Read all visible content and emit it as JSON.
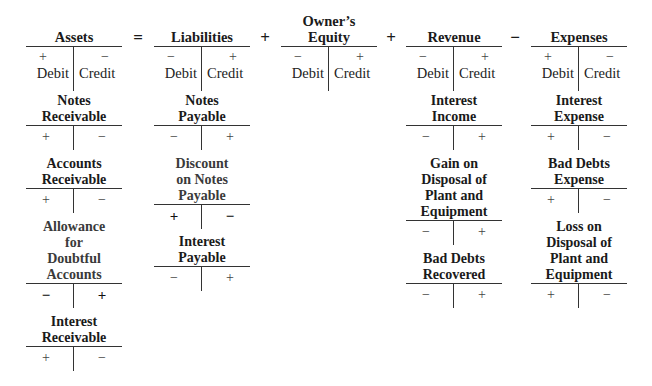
{
  "equation": {
    "operators": [
      "=",
      "+",
      "+",
      "−"
    ],
    "columns": [
      {
        "title": "Assets",
        "debit_sign": "+",
        "credit_sign": "−",
        "debit_label": "Debit",
        "credit_label": "Credit"
      },
      {
        "title": "Liabilities",
        "debit_sign": "−",
        "credit_sign": "+",
        "debit_label": "Debit",
        "credit_label": "Credit"
      },
      {
        "title_line1": "Owner’s",
        "title_line2": "Equity",
        "debit_sign": "−",
        "credit_sign": "+",
        "debit_label": "Debit",
        "credit_label": "Credit"
      },
      {
        "title": "Revenue",
        "debit_sign": "−",
        "credit_sign": "+",
        "debit_label": "Debit",
        "credit_label": "Credit"
      },
      {
        "title": "Expenses",
        "debit_sign": "+",
        "credit_sign": "−",
        "debit_label": "Debit",
        "credit_label": "Credit"
      }
    ]
  },
  "accounts": {
    "assets": [
      {
        "lines": [
          "Notes",
          "Receivable"
        ],
        "left": "+",
        "right": "−"
      },
      {
        "lines": [
          "Accounts",
          "Receivable"
        ],
        "left": "+",
        "right": "−"
      },
      {
        "lines": [
          "Allowance",
          "for",
          "Doubtful",
          "Accounts"
        ],
        "left": "−",
        "right": "+"
      },
      {
        "lines": [
          "Interest",
          "Receivable"
        ],
        "left": "+",
        "right": "−"
      }
    ],
    "liabilities": [
      {
        "lines": [
          "Notes",
          "Payable"
        ],
        "left": "−",
        "right": "+"
      },
      {
        "lines": [
          "Discount",
          "on Notes",
          "Payable"
        ],
        "left": "+",
        "right": "−"
      },
      {
        "lines": [
          "Interest",
          "Payable"
        ],
        "left": "−",
        "right": "+"
      }
    ],
    "revenue": [
      {
        "lines": [
          "Interest",
          "Income"
        ],
        "left": "−",
        "right": "+"
      },
      {
        "lines": [
          "Gain on",
          "Disposal of",
          "Plant and",
          "Equipment"
        ],
        "left": "−",
        "right": "+"
      },
      {
        "lines": [
          "Bad Debts",
          "Recovered"
        ],
        "left": "−",
        "right": "+"
      }
    ],
    "expenses": [
      {
        "lines": [
          "Interest",
          "Expense"
        ],
        "left": "+",
        "right": "−"
      },
      {
        "lines": [
          "Bad Debts",
          "Expense"
        ],
        "left": "+",
        "right": "−"
      },
      {
        "lines": [
          "Loss on",
          "Disposal of",
          "Plant and",
          "Equipment"
        ],
        "left": "+",
        "right": "−"
      }
    ]
  }
}
